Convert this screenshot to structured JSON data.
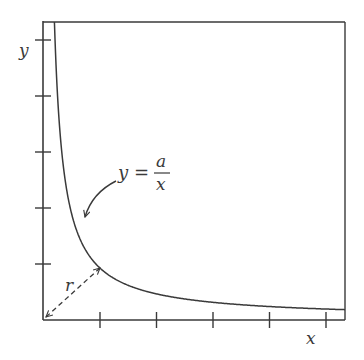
{
  "diagram": {
    "title": "",
    "x_axis_label": "x",
    "y_axis_label": "y",
    "curve_label": {
      "lhs": "y",
      "equals": "=",
      "numerator": "a",
      "denominator": "x"
    },
    "distance_label": "r",
    "x_ticks_count": 5,
    "y_ticks_count": 5,
    "colors": {
      "line": "#3a3a3a",
      "background": "#ffffff"
    }
  },
  "chart_data": {
    "type": "line",
    "title": "",
    "xlabel": "x",
    "ylabel": "y",
    "series": [
      {
        "name": "y = a/x",
        "function": "y = a/x"
      }
    ],
    "annotations": [
      {
        "text": "y = a/x",
        "type": "curved-arrow-label"
      },
      {
        "text": "r",
        "type": "double-headed dashed arrow from origin to curve"
      }
    ],
    "x_ticks": 5,
    "y_ticks": 5,
    "grid": false,
    "legend": "none"
  }
}
